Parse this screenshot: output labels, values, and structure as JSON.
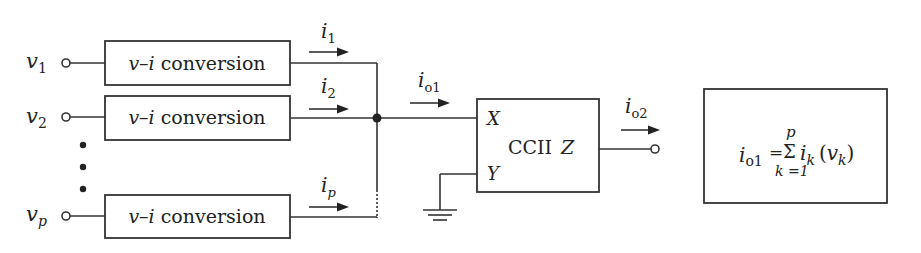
{
  "inputs": [
    {
      "symbol": "v",
      "subscript": "1"
    },
    {
      "symbol": "v",
      "subscript": "2"
    },
    {
      "symbol": "v",
      "subscript": "p"
    }
  ],
  "converter_label": {
    "v": "v",
    "dash": "–",
    "i": "i",
    "rest": " conversion"
  },
  "currents": [
    {
      "symbol": "i",
      "subscript": "1"
    },
    {
      "symbol": "i",
      "subscript": "2"
    },
    {
      "symbol": "i",
      "subscript": "p"
    }
  ],
  "io1": {
    "symbol": "i",
    "subscript": "o1"
  },
  "io2": {
    "symbol": "i",
    "subscript": "o2"
  },
  "ccii": {
    "name": "CCII",
    "port_x": "X",
    "port_y": "Y",
    "port_z": "Z"
  },
  "equation": {
    "lhs_symbol": "i",
    "lhs_sub": "o1",
    "equals": "=",
    "sum": "Σ",
    "upper": "p",
    "lower": "k =1",
    "term_symbol": "i",
    "term_sub": "k",
    "open": "(",
    "arg_symbol": "v",
    "arg_sub": "k",
    "close": ")"
  }
}
